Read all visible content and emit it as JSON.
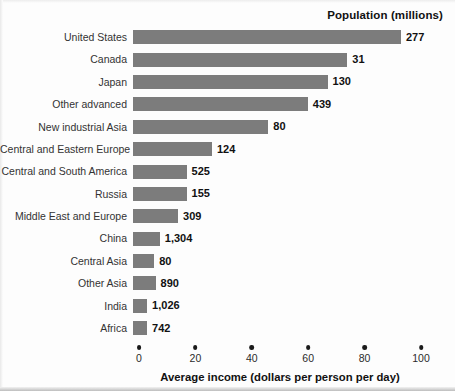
{
  "header": {
    "population_header": "Population (millions)"
  },
  "axis": {
    "x_title": "Average income (dollars per person per day)",
    "ticks": [
      "0",
      "20",
      "40",
      "60",
      "80",
      "100"
    ]
  },
  "chart_data": {
    "type": "bar",
    "orientation": "horizontal",
    "title": "",
    "xlabel": "Average income (dollars per person per day)",
    "ylabel": "",
    "xlim": [
      0,
      100
    ],
    "xticks": [
      0,
      20,
      40,
      60,
      80,
      100
    ],
    "grid": false,
    "legend": "none",
    "bar_color": "#7c7c7c",
    "value_label_header": "Population (millions)",
    "categories": [
      "United States",
      "Canada",
      "Japan",
      "Other advanced",
      "New industrial Asia",
      "Central and Eastern Europe",
      "Central and South America",
      "Russia",
      "Middle East and Europe",
      "China",
      "Central Asia",
      "Other Asia",
      "India",
      "Africa"
    ],
    "values": [
      95,
      76,
      69,
      62,
      48,
      28,
      19,
      19,
      16,
      9.5,
      7.5,
      8,
      5,
      5
    ],
    "population_labels": [
      "277",
      "31",
      "130",
      "439",
      "80",
      "124",
      "525",
      "155",
      "309",
      "1,304",
      "80",
      "890",
      "1,026",
      "742"
    ],
    "populations": [
      277,
      31,
      130,
      439,
      80,
      124,
      525,
      155,
      309,
      1304,
      80,
      890,
      1026,
      742
    ]
  }
}
